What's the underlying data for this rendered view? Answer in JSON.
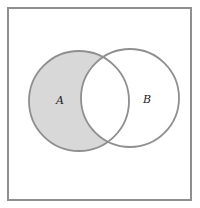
{
  "figure": {
    "kind": "venn-diagram-two-sets",
    "universe_box": {
      "stroke_color": "#8f8f8f",
      "fill_color": "#ffffff"
    },
    "sets": {
      "a": {
        "label": "A",
        "fill_color": "#d8d8d8",
        "shaded": true
      },
      "b": {
        "label": "B",
        "fill_color": "#ffffff",
        "shaded": false
      }
    },
    "circle_stroke_color": "#8f8f8f",
    "label_color": "#222222"
  }
}
